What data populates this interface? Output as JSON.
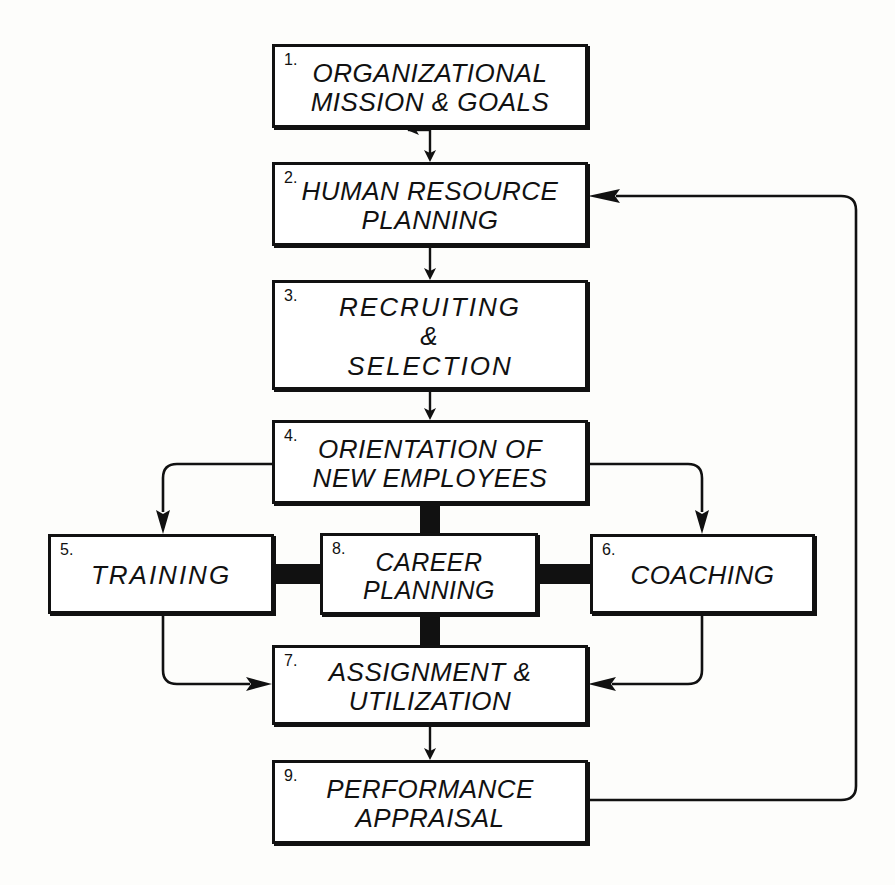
{
  "diagram": {
    "background_color": "#fdfdfb",
    "line_color": "#111111",
    "box_fill": "#ffffff"
  },
  "nodes": [
    {
      "id": "n1",
      "number": "1.",
      "label": "ORGANIZATIONAL\nMISSION & GOALS",
      "x": 272,
      "y": 44,
      "w": 316,
      "h": 84
    },
    {
      "id": "n2",
      "number": "2.",
      "label": "HUMAN RESOURCE\nPLANNING",
      "x": 272,
      "y": 162,
      "w": 316,
      "h": 84
    },
    {
      "id": "n3",
      "number": "3.",
      "label": "RECRUITING\n&\nSELECTION",
      "x": 272,
      "y": 280,
      "w": 316,
      "h": 110
    },
    {
      "id": "n4",
      "number": "4.",
      "label": "ORIENTATION OF\nNEW EMPLOYEES",
      "x": 272,
      "y": 420,
      "w": 316,
      "h": 84
    },
    {
      "id": "n5",
      "number": "5.",
      "label": "TRAINING",
      "x": 48,
      "y": 534,
      "w": 226,
      "h": 80
    },
    {
      "id": "n8",
      "number": "8.",
      "label": "CAREER\nPLANNING",
      "x": 320,
      "y": 533,
      "w": 218,
      "h": 82
    },
    {
      "id": "n6",
      "number": "6.",
      "label": "COACHING",
      "x": 590,
      "y": 534,
      "w": 225,
      "h": 80
    },
    {
      "id": "n7",
      "number": "7.",
      "label": "ASSIGNMENT &\nUTILIZATION",
      "x": 272,
      "y": 645,
      "w": 316,
      "h": 80
    },
    {
      "id": "n9",
      "number": "9.",
      "label": "PERFORMANCE\nAPPRAISAL",
      "x": 272,
      "y": 760,
      "w": 316,
      "h": 84
    }
  ],
  "connections": [
    {
      "id": "c1",
      "from": "n1",
      "to": "n2",
      "style": "thin-arrow",
      "direction": "down"
    },
    {
      "id": "c2",
      "from": "n2",
      "to": "n3",
      "style": "thin-arrow",
      "direction": "down"
    },
    {
      "id": "c3",
      "from": "n3",
      "to": "n4",
      "style": "thin-arrow",
      "direction": "down"
    },
    {
      "id": "c4",
      "from": "n4",
      "to": "n5",
      "style": "thin-arrow",
      "direction": "left-down"
    },
    {
      "id": "c5",
      "from": "n4",
      "to": "n6",
      "style": "thin-arrow",
      "direction": "right-down"
    },
    {
      "id": "c6",
      "from": "n4",
      "to": "n8",
      "style": "thick-bar",
      "direction": "down"
    },
    {
      "id": "c7",
      "from": "n5",
      "to": "n8",
      "style": "thick-bar",
      "direction": "right"
    },
    {
      "id": "c8",
      "from": "n8",
      "to": "n6",
      "style": "thick-bar",
      "direction": "right"
    },
    {
      "id": "c9",
      "from": "n8",
      "to": "n7",
      "style": "thick-bar",
      "direction": "down"
    },
    {
      "id": "c10",
      "from": "n5",
      "to": "n7",
      "style": "thin-arrow",
      "direction": "down-right"
    },
    {
      "id": "c11",
      "from": "n6",
      "to": "n7",
      "style": "thin-arrow",
      "direction": "down-left"
    },
    {
      "id": "c12",
      "from": "n7",
      "to": "n9",
      "style": "thin-arrow",
      "direction": "down"
    },
    {
      "id": "c13",
      "from": "n9",
      "to": "n2",
      "style": "thin-arrow",
      "direction": "feedback-right-up"
    }
  ]
}
